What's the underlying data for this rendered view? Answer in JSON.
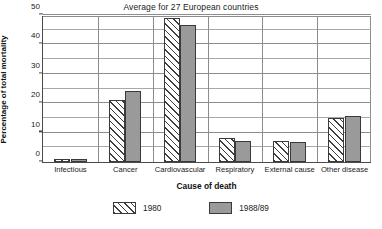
{
  "chart_data": {
    "type": "bar",
    "title": "Average for 27 European countries",
    "xlabel": "Cause of death",
    "ylabel": "Percentage of total mortality",
    "ylim": [
      0,
      50
    ],
    "yticks": [
      0,
      10,
      20,
      30,
      40,
      50
    ],
    "yticklabels": [
      "0",
      "10",
      "20",
      "30",
      "40",
      "50"
    ],
    "minor_gridlines": [
      5,
      15,
      25,
      35,
      45
    ],
    "grid": true,
    "legend_position": "bottom",
    "categories": [
      "Infectious",
      "Cancer",
      "Cardiovascular",
      "Respiratory",
      "External cause",
      "Other disease"
    ],
    "series": [
      {
        "name": "1980",
        "values": [
          1.0,
          21.0,
          49.0,
          8.0,
          7.0,
          15.0
        ]
      },
      {
        "name": "1988/89",
        "values": [
          1.0,
          24.3,
          46.5,
          7.0,
          6.7,
          15.7
        ]
      }
    ],
    "colors": {
      "series_1980_fill": "#ffffff",
      "series_1980_hatch": "#3d3d3d",
      "series_1988_fill": "#9a9a9a",
      "bar_outline": "#3a3a3a",
      "gridline": "#8c8c8c",
      "axis": "#4a4a4a"
    }
  }
}
